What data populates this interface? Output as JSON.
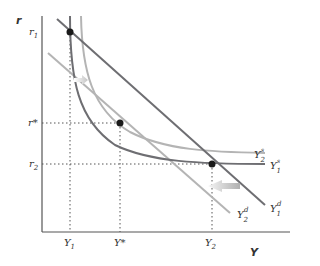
{
  "axes": {
    "y_label": "r",
    "x_label": "Y"
  },
  "y_ticks": [
    {
      "base": "r",
      "sub": "1",
      "y": 32
    },
    {
      "base": "r*",
      "sub": "",
      "y": 123
    },
    {
      "base": "r",
      "sub": "2",
      "y": 164
    }
  ],
  "x_ticks": [
    {
      "base": "Y",
      "sub": "1",
      "x": 70
    },
    {
      "base": "Y*",
      "sub": "",
      "x": 120
    },
    {
      "base": "Y",
      "sub": "2",
      "x": 212
    }
  ],
  "curves": {
    "y1s": {
      "base": "Y",
      "sub": "1",
      "sup": "s"
    },
    "y2s": {
      "base": "Y",
      "sub": "2",
      "sup": "s"
    },
    "y1d": {
      "base": "Y",
      "sub": "1",
      "sup": "d"
    },
    "y2d": {
      "base": "Y",
      "sub": "2",
      "sup": "d"
    }
  },
  "colors": {
    "dark_curve": "#6e6e72",
    "light_curve": "#b4b4b4",
    "axis": "#555555",
    "point": "#1a1a1a"
  },
  "points": [
    {
      "name": "r1-Y1",
      "x": 70,
      "y": 32
    },
    {
      "name": "rstar-Ystar",
      "x": 120,
      "y": 123
    },
    {
      "name": "r2-Y2",
      "x": 212,
      "y": 164
    }
  ]
}
